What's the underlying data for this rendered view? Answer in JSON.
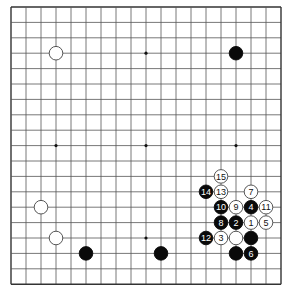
{
  "board": {
    "size": 19,
    "origin": {
      "x": 11,
      "y": 7
    },
    "spacing": {
      "x": 15.0,
      "y": 15.4
    },
    "line_color": "#555555",
    "border_color": "#333333",
    "background": "#ffffff",
    "stone_radius": 6.8
  },
  "star_points": [
    {
      "col": 9,
      "row": 3
    },
    {
      "col": 3,
      "row": 9
    },
    {
      "col": 9,
      "row": 9
    },
    {
      "col": 15,
      "row": 9
    },
    {
      "col": 9,
      "row": 15
    }
  ],
  "stones": [
    {
      "color": "white",
      "col": 3,
      "row": 3,
      "label": ""
    },
    {
      "color": "black",
      "col": 15,
      "row": 3,
      "label": ""
    },
    {
      "color": "white",
      "col": 2,
      "row": 13,
      "label": ""
    },
    {
      "color": "white",
      "col": 3,
      "row": 15,
      "label": ""
    },
    {
      "color": "black",
      "col": 5,
      "row": 16,
      "label": ""
    },
    {
      "color": "black",
      "col": 10,
      "row": 16,
      "label": ""
    },
    {
      "color": "white",
      "col": 15,
      "row": 15,
      "label": ""
    },
    {
      "color": "black",
      "col": 16,
      "row": 15,
      "label": ""
    },
    {
      "color": "black",
      "col": 15,
      "row": 16,
      "label": ""
    },
    {
      "color": "white",
      "col": 16,
      "row": 14,
      "label": "1"
    },
    {
      "color": "black",
      "col": 15,
      "row": 14,
      "label": "2"
    },
    {
      "color": "white",
      "col": 14,
      "row": 15,
      "label": "3"
    },
    {
      "color": "black",
      "col": 16,
      "row": 13,
      "label": "4"
    },
    {
      "color": "white",
      "col": 17,
      "row": 14,
      "label": "5"
    },
    {
      "color": "black",
      "col": 16,
      "row": 16,
      "label": "6"
    },
    {
      "color": "white",
      "col": 16,
      "row": 12,
      "label": "7"
    },
    {
      "color": "black",
      "col": 14,
      "row": 14,
      "label": "8"
    },
    {
      "color": "white",
      "col": 15,
      "row": 13,
      "label": "9"
    },
    {
      "color": "black",
      "col": 14,
      "row": 13,
      "label": "10"
    },
    {
      "color": "white",
      "col": 17,
      "row": 13,
      "label": "11"
    },
    {
      "color": "black",
      "col": 13,
      "row": 15,
      "label": "12"
    },
    {
      "color": "white",
      "col": 14,
      "row": 12,
      "label": "13"
    },
    {
      "color": "black",
      "col": 13,
      "row": 12,
      "label": "14"
    },
    {
      "color": "white",
      "col": 14,
      "row": 11,
      "label": "15"
    }
  ]
}
